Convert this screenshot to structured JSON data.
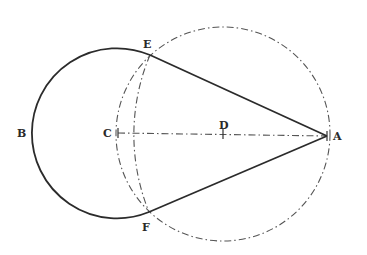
{
  "figure": {
    "labels": {
      "A": "A",
      "B": "B",
      "C": "C",
      "D": "D",
      "E": "E",
      "F": "F"
    },
    "points": {
      "A": [
        327,
        136
      ],
      "C": [
        118,
        133
      ],
      "D": [
        223,
        134
      ],
      "E": [
        150,
        55
      ],
      "F": [
        149,
        212
      ],
      "B": [
        32,
        133
      ]
    },
    "circles": [
      {
        "name": "circle-C",
        "center": "C",
        "radius": 85,
        "style": "solid-arc E-B-F"
      },
      {
        "name": "circle-D",
        "center": "D",
        "radius": 107,
        "style": "dash-dot"
      },
      {
        "name": "arc-A",
        "center": "A",
        "radius": 205,
        "style": "dash-dot arc E-C-F"
      }
    ],
    "lines": [
      {
        "from": "A",
        "to": "E",
        "style": "solid"
      },
      {
        "from": "A",
        "to": "F",
        "style": "solid"
      },
      {
        "from": "C",
        "to": "A",
        "style": "dash-dot"
      }
    ],
    "colors": {
      "ink": "#2b2b2b",
      "construction": "#555555",
      "background": "#ffffff"
    }
  }
}
